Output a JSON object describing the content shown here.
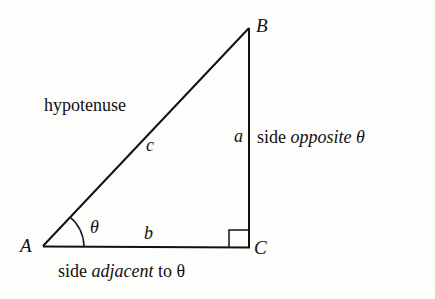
{
  "diagram": {
    "type": "right-triangle",
    "vertices": {
      "A": {
        "label": "A",
        "x": 43,
        "y": 246
      },
      "B": {
        "label": "B",
        "x": 249,
        "y": 28
      },
      "C": {
        "label": "C",
        "x": 249,
        "y": 247
      }
    },
    "sides": {
      "a": {
        "label": "a",
        "description_prefix": "side ",
        "description_em": "opposite",
        "description_suffix": " θ"
      },
      "b": {
        "label": "b",
        "description_prefix": "side ",
        "description_em": "adjacent",
        "description_suffix": " to θ"
      },
      "c": {
        "label": "c",
        "description": "hypotenuse"
      }
    },
    "angle": {
      "label": "θ",
      "at_vertex": "A"
    },
    "right_angle_marker": {
      "at_vertex": "C"
    },
    "stroke_color": "#111111",
    "background_color": "#fdfdfc"
  }
}
